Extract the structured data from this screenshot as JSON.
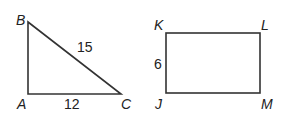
{
  "triangle": {
    "vertices": {
      "A": "A",
      "B": "B",
      "C": "C"
    },
    "sides": {
      "BC": "15",
      "AC": "12"
    }
  },
  "rectangle": {
    "vertices": {
      "J": "J",
      "K": "K",
      "L": "L",
      "M": "M"
    },
    "sides": {
      "JK": "6"
    }
  }
}
